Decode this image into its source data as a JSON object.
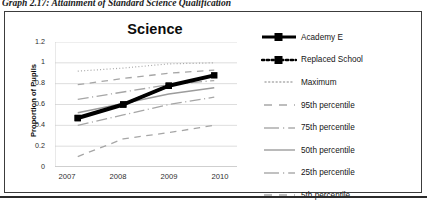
{
  "document": {
    "caption": "Graph 2.17: Attainment of Standard Science Qualification"
  },
  "chart": {
    "title": "Science",
    "y_axis_title": "Proportion of Pupils"
  },
  "legend": {
    "position": "right",
    "items": [
      {
        "label": "Academy E",
        "key": "thick-solid-black-square-marker"
      },
      {
        "label": "Replaced School",
        "key": "dotted-black-square-marker"
      },
      {
        "label": "Maximum",
        "key": "fine-dotted-gray"
      },
      {
        "label": "95th percentile",
        "key": "long-dashed-gray"
      },
      {
        "label": "75th percentile",
        "key": "dash-dot-gray"
      },
      {
        "label": "50th percentile",
        "key": "solid-gray"
      },
      {
        "label": "25th  percentile",
        "key": "dash-dot-gray"
      },
      {
        "label": "5th percentile",
        "key": "long-dashed-gray"
      }
    ]
  },
  "chart_data": {
    "type": "line",
    "title": "Science",
    "xlabel": "",
    "ylabel": "Proportion of Pupils",
    "x": [
      "2007",
      "2008",
      "2009",
      "2010"
    ],
    "categories": [
      "2007",
      "2008",
      "2009",
      "2010"
    ],
    "ylim": [
      0,
      1.2
    ],
    "yticks": [
      0,
      0.2,
      0.4,
      0.6,
      0.8,
      1,
      1.2
    ],
    "ytick_labels": [
      "0",
      "0.2",
      "0.4",
      "0.6",
      "0.8",
      "1",
      "1.2"
    ],
    "grid": "horizontal",
    "legend_position": "right",
    "series": [
      {
        "name": "Academy E",
        "values": [
          0.47,
          0.6,
          0.78,
          0.88
        ],
        "style": "thick-solid",
        "color": "#000000",
        "marker": "square"
      },
      {
        "name": "Replaced School",
        "values": [
          0.47,
          0.6,
          0.78,
          null
        ],
        "style": "dotted",
        "color": "#000000",
        "marker": "square"
      },
      {
        "name": "Maximum",
        "values": [
          0.92,
          0.95,
          0.99,
          1.0
        ],
        "style": "fine-dotted",
        "color": "#a6a6a6",
        "marker": "none"
      },
      {
        "name": "95th percentile",
        "values": [
          0.79,
          0.85,
          0.9,
          0.93
        ],
        "style": "long-dashed",
        "color": "#a6a6a6",
        "marker": "none"
      },
      {
        "name": "75th percentile",
        "values": [
          0.65,
          0.72,
          0.79,
          0.83
        ],
        "style": "dash-dot",
        "color": "#a6a6a6",
        "marker": "none"
      },
      {
        "name": "50th percentile",
        "values": [
          0.52,
          0.61,
          0.7,
          0.76
        ],
        "style": "solid",
        "color": "#9c9c9c",
        "marker": "none"
      },
      {
        "name": "25th  percentile",
        "values": [
          0.4,
          0.5,
          0.6,
          0.67
        ],
        "style": "dash-dot",
        "color": "#a6a6a6",
        "marker": "none"
      },
      {
        "name": "5th percentile",
        "values": [
          0.1,
          0.27,
          0.33,
          0.4
        ],
        "style": "long-dashed",
        "color": "#a6a6a6",
        "marker": "none"
      }
    ]
  }
}
